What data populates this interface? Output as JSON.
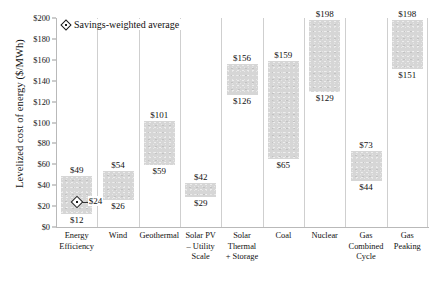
{
  "chart_data": {
    "type": "bar",
    "subtype": "floating-range-bar",
    "title": "",
    "xlabel": "",
    "ylabel": "Levelized cost of energy ($/MWh)",
    "ylim": [
      0,
      200
    ],
    "ytick_values": [
      0,
      20,
      40,
      60,
      80,
      100,
      120,
      140,
      160,
      180,
      200
    ],
    "ytick_labels": [
      "$0",
      "$20",
      "$40",
      "$60",
      "$80",
      "$100",
      "$120",
      "$140",
      "$160",
      "$180",
      "$200"
    ],
    "grid": false,
    "legend_position": "top-left",
    "legend": [
      {
        "label": "Savings-weighted average",
        "marker": "diamond"
      }
    ],
    "categories": [
      "Energy Efficiency",
      "Wind",
      "Geothermal",
      "Solar PV – Utility Scale",
      "Solar Thermal + Storage",
      "Coal",
      "Nuclear",
      "Gas Combined Cycle",
      "Gas Peaking"
    ],
    "category_lines": [
      [
        "Energy",
        "Efficiency"
      ],
      [
        "Wind"
      ],
      [
        "Geothermal"
      ],
      [
        "Solar PV",
        "– Utility",
        "Scale"
      ],
      [
        "Solar",
        "Thermal",
        "+ Storage"
      ],
      [
        "Coal"
      ],
      [
        "Nuclear"
      ],
      [
        "Gas",
        "Combined",
        "Cycle"
      ],
      [
        "Gas",
        "Peaking"
      ]
    ],
    "bars": [
      {
        "category": "Energy Efficiency",
        "low": 12,
        "high": 49,
        "low_label": "$12",
        "high_label": "$49"
      },
      {
        "category": "Wind",
        "low": 26,
        "high": 54,
        "low_label": "$26",
        "high_label": "$54"
      },
      {
        "category": "Geothermal",
        "low": 59,
        "high": 101,
        "low_label": "$59",
        "high_label": "$101"
      },
      {
        "category": "Solar PV – Utility Scale",
        "low": 29,
        "high": 42,
        "low_label": "$29",
        "high_label": "$42"
      },
      {
        "category": "Solar Thermal + Storage",
        "low": 126,
        "high": 156,
        "low_label": "$126",
        "high_label": "$156"
      },
      {
        "category": "Coal",
        "low": 65,
        "high": 159,
        "low_label": "$65",
        "high_label": "$159"
      },
      {
        "category": "Nuclear",
        "low": 129,
        "high": 198,
        "low_label": "$129",
        "high_label": "$198"
      },
      {
        "category": "Gas Combined Cycle",
        "low": 44,
        "high": 73,
        "low_label": "$44",
        "high_label": "$73"
      },
      {
        "category": "Gas Peaking",
        "low": 151,
        "high": 198,
        "low_label": "$151",
        "high_label": "$198"
      }
    ],
    "markers": [
      {
        "category": "Energy Efficiency",
        "value": 24,
        "label": "$24",
        "type": "savings-weighted-average"
      }
    ],
    "colors": {
      "bar_fill": "#d6d6d6",
      "axis": "#b9b9b9",
      "separator": "#cfcfcf",
      "text": "#111111",
      "marker": "#1a1a1a",
      "background": "#ffffff"
    }
  }
}
